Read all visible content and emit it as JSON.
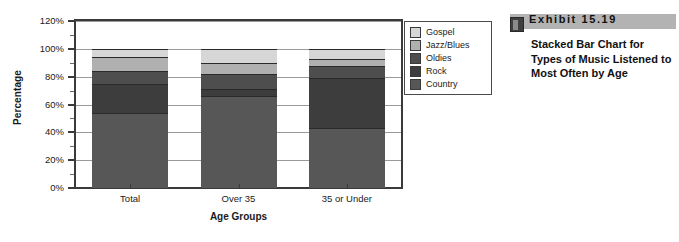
{
  "chart_data": {
    "type": "bar",
    "stacked": true,
    "title": "",
    "xlabel": "Age Groups",
    "ylabel": "Percentage",
    "ylim": [
      0,
      120
    ],
    "ytick_labels": [
      "0%",
      "20%",
      "40%",
      "60%",
      "80%",
      "100%",
      "120%"
    ],
    "ytick_values": [
      0,
      20,
      40,
      60,
      80,
      100,
      120
    ],
    "yminor_values": [
      10,
      30,
      50,
      70,
      90,
      110
    ],
    "grid": true,
    "legend_position": "right",
    "categories": [
      "Total",
      "Over 35",
      "35 or Under"
    ],
    "series": [
      {
        "name": "Country",
        "color": "#575757",
        "values": [
          54,
          66,
          43
        ]
      },
      {
        "name": "Rock",
        "color": "#3d3d3d",
        "values": [
          21,
          5,
          36
        ]
      },
      {
        "name": "Oldies",
        "color": "#4e4e4e",
        "values": [
          9,
          11,
          9
        ]
      },
      {
        "name": "Jazz/Blues",
        "color": "#b0b0b0",
        "values": [
          10,
          8,
          5
        ]
      },
      {
        "name": "Gospel",
        "color": "#d6d6d6",
        "values": [
          6,
          10,
          7
        ]
      }
    ],
    "legend_order": [
      "Gospel",
      "Jazz/Blues",
      "Oldies",
      "Rock",
      "Country"
    ]
  },
  "legend": {
    "items": [
      {
        "label": "Gospel",
        "color": "#d6d6d6"
      },
      {
        "label": "Jazz/Blues",
        "color": "#b0b0b0"
      },
      {
        "label": "Oldies",
        "color": "#4e4e4e"
      },
      {
        "label": "Rock",
        "color": "#3d3d3d"
      },
      {
        "label": "Country",
        "color": "#575757"
      }
    ]
  },
  "caption": {
    "exhibit_label": "Exhibit  15.19",
    "body": "Stacked Bar Chart for Types of Music Listened to Most Often by Age",
    "banner_color": "#b3b3b3",
    "marker_color": "#3f3f3f"
  }
}
